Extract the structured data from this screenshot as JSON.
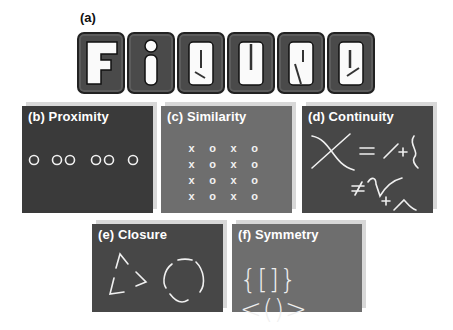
{
  "figure": {
    "label_a": "(a)",
    "title_word": "Figure",
    "title_letters": [
      "F",
      "i",
      "g",
      "u",
      "r",
      "e"
    ]
  },
  "panels": {
    "b": {
      "title": "(b) Proximity",
      "circles_x": [
        34,
        57,
        70,
        96,
        109,
        133
      ]
    },
    "c": {
      "title": "(c) Similarity",
      "grid": [
        [
          "x",
          "o",
          "x",
          "o"
        ],
        [
          "x",
          "o",
          "x",
          "o"
        ],
        [
          "x",
          "o",
          "x",
          "o"
        ],
        [
          "x",
          "o",
          "x",
          "o"
        ]
      ]
    },
    "d": {
      "title": "(d) Continuity",
      "symbols": [
        "=",
        "+",
        "≠",
        "+"
      ]
    },
    "e": {
      "title": "(e) Closure"
    },
    "f": {
      "title": "(f) Symmetry",
      "text": "{[]}<()>"
    }
  },
  "colors": {
    "dark_panel": "#3a3a3a",
    "mid_panel": "#6e6e6e",
    "stroke": "#f0f0f0"
  }
}
